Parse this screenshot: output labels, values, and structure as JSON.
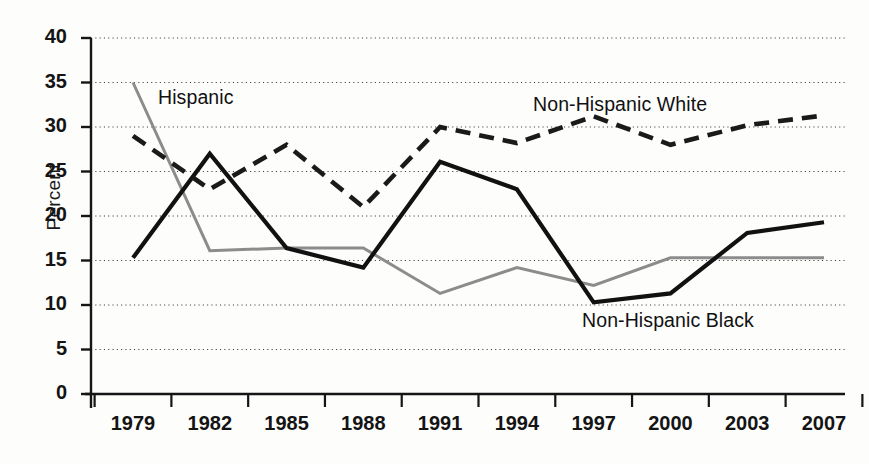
{
  "chart_data": {
    "type": "line",
    "title": "",
    "subtitle": "",
    "xlabel": "",
    "ylabel": "Percent",
    "categories": [
      "1979",
      "1982",
      "1985",
      "1988",
      "1991",
      "1994",
      "1997",
      "2000",
      "2003",
      "2007"
    ],
    "x": [
      1979,
      1982,
      1985,
      1988,
      1991,
      1994,
      1997,
      2000,
      2003,
      2007
    ],
    "ylim": [
      0,
      40
    ],
    "ytick_labels": [
      "0",
      "5",
      "10",
      "15",
      "20",
      "25",
      "30",
      "35",
      "40"
    ],
    "ytick_values": [
      0,
      5,
      10,
      15,
      20,
      25,
      30,
      35,
      40
    ],
    "grid": true,
    "grid_style": "dotted-horizontal",
    "legend_position": "inline-annotations",
    "series": [
      {
        "name": "Hispanic",
        "style": "solid",
        "color": "#8c8c8c",
        "values": [
          35.0,
          16.1,
          16.4,
          16.4,
          11.3,
          14.2,
          12.2,
          15.3,
          15.3,
          15.3
        ]
      },
      {
        "name": "Non-Hispanic Black",
        "style": "solid",
        "color": "#111111",
        "values": [
          15.3,
          27.0,
          16.4,
          14.2,
          26.1,
          23.0,
          10.3,
          11.3,
          18.1,
          19.3
        ]
      },
      {
        "name": "Non-Hispanic White",
        "style": "dashed",
        "color": "#1a1a1a",
        "values": [
          29.0,
          23.0,
          28.0,
          21.0,
          30.0,
          28.2,
          31.2,
          28.0,
          30.2,
          31.3
        ]
      }
    ],
    "annotations": [
      {
        "text": "Hispanic",
        "x": 158,
        "y": 86
      },
      {
        "text": "Non-Hispanic White",
        "x": 533,
        "y": 93
      },
      {
        "text": "Non-Hispanic Black",
        "x": 582,
        "y": 309
      }
    ]
  },
  "axis": {
    "y_title": "Percent"
  }
}
